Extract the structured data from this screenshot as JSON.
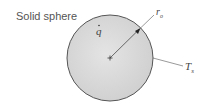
{
  "diagram": {
    "title": "Solid sphere",
    "labels": {
      "generation": "q",
      "radius": "r",
      "radius_sub": "o",
      "surface_temp": "T",
      "surface_temp_sub": "s"
    },
    "colors": {
      "sphere_fill": "#d9d9d9",
      "sphere_stroke": "#555555",
      "line": "#333333"
    }
  }
}
